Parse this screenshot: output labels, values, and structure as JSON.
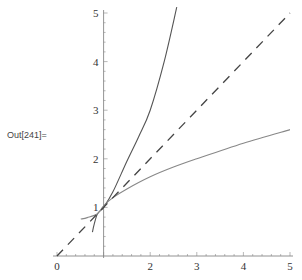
{
  "output_label": "Out[241]=",
  "chart_data": {
    "type": "line",
    "title": "",
    "xlabel": "",
    "ylabel": "",
    "xlim": [
      0,
      5
    ],
    "ylim": [
      0,
      5
    ],
    "axes_origin": [
      1,
      0
    ],
    "grid": false,
    "legend": null,
    "x_ticks": [
      0,
      2,
      3,
      4,
      5
    ],
    "y_ticks": [
      1,
      2,
      3,
      4,
      5
    ],
    "series": [
      {
        "name": "steep-curve",
        "style": "solid",
        "color": "#555555",
        "points": [
          [
            0.76,
            0.49
          ],
          [
            0.8,
            0.66
          ],
          [
            0.87,
            0.87
          ],
          [
            1.0,
            1.0
          ],
          [
            1.2,
            1.32
          ],
          [
            1.5,
            1.95
          ],
          [
            1.75,
            2.45
          ],
          [
            2.0,
            3.0
          ],
          [
            2.3,
            4.0
          ],
          [
            2.57,
            5.12
          ]
        ]
      },
      {
        "name": "flat-curve",
        "style": "solid",
        "color": "#888888",
        "points": [
          [
            0.51,
            0.76
          ],
          [
            0.65,
            0.79
          ],
          [
            0.87,
            0.87
          ],
          [
            1.0,
            1.03
          ],
          [
            1.2,
            1.2
          ],
          [
            1.5,
            1.38
          ],
          [
            2.0,
            1.63
          ],
          [
            2.5,
            1.83
          ],
          [
            3.0,
            2.0
          ],
          [
            4.0,
            2.32
          ],
          [
            5.0,
            2.6
          ]
        ]
      },
      {
        "name": "identity-line",
        "style": "dashed",
        "color": "#444444",
        "points": [
          [
            0,
            0
          ],
          [
            5,
            5
          ]
        ]
      }
    ]
  }
}
